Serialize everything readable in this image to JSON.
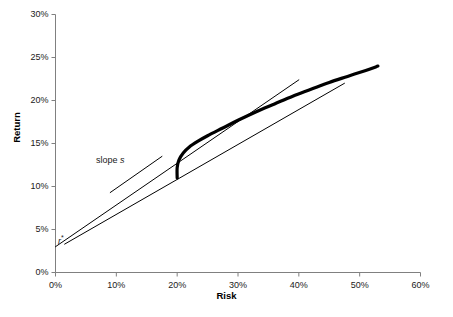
{
  "chart_data": {
    "type": "line",
    "title": "",
    "xlabel": "Risk",
    "ylabel": "Return",
    "xlim": [
      0,
      60
    ],
    "ylim": [
      0,
      30
    ],
    "grid": false,
    "legend": "none",
    "x_ticks": [
      "0%",
      "10%",
      "20%",
      "30%",
      "40%",
      "50%",
      "60%"
    ],
    "x_tick_values": [
      0,
      10,
      20,
      30,
      40,
      50,
      60
    ],
    "y_ticks": [
      "0%",
      "5%",
      "10%",
      "15%",
      "20%",
      "25%",
      "30%"
    ],
    "y_tick_values": [
      0,
      5,
      10,
      15,
      20,
      25,
      30
    ],
    "series": [
      {
        "name": "efficient-frontier",
        "style": "thick-curve",
        "linewidth": 3.2,
        "color": "#000000",
        "points": [
          [
            20.0,
            11.0
          ],
          [
            20.0,
            12.2
          ],
          [
            20.3,
            13.1
          ],
          [
            21.0,
            13.9
          ],
          [
            22.0,
            14.6
          ],
          [
            23.5,
            15.3
          ],
          [
            25.0,
            15.9
          ],
          [
            27.5,
            16.8
          ],
          [
            30.0,
            17.7
          ],
          [
            33.0,
            18.7
          ],
          [
            36.0,
            19.6
          ],
          [
            39.0,
            20.5
          ],
          [
            42.0,
            21.3
          ],
          [
            45.0,
            22.1
          ],
          [
            48.0,
            22.8
          ],
          [
            51.0,
            23.5
          ],
          [
            53.0,
            24.0
          ]
        ]
      },
      {
        "name": "capital-market-line",
        "style": "thin-line",
        "linewidth": 1,
        "color": "#000000",
        "points": [
          [
            0.0,
            3.0
          ],
          [
            40.0,
            22.4
          ]
        ]
      },
      {
        "name": "secondary-tangent-line",
        "style": "thin-line",
        "linewidth": 1,
        "color": "#000000",
        "points": [
          [
            1.5,
            3.3
          ],
          [
            47.5,
            22.0
          ]
        ]
      },
      {
        "name": "slope-pointer-line",
        "style": "thin-line",
        "linewidth": 1,
        "color": "#000000",
        "points": [
          [
            9.0,
            9.3
          ],
          [
            17.5,
            13.5
          ]
        ]
      }
    ],
    "annotations": [
      {
        "name": "slope-annotation",
        "text": "slope s",
        "text_prefix": "slope ",
        "symbol": "s",
        "x": 7.0,
        "y": 14.5
      },
      {
        "name": "risk-free-rate-annotation",
        "text": "r*",
        "symbol": "r",
        "star": "*",
        "x": 0.6,
        "y": 4.8
      }
    ]
  },
  "axes": {
    "x_title": "Risk",
    "y_title": "Return"
  },
  "colors": {
    "axis": "#808080",
    "line": "#000000",
    "text": "#1a1a1a",
    "background": "#ffffff"
  }
}
